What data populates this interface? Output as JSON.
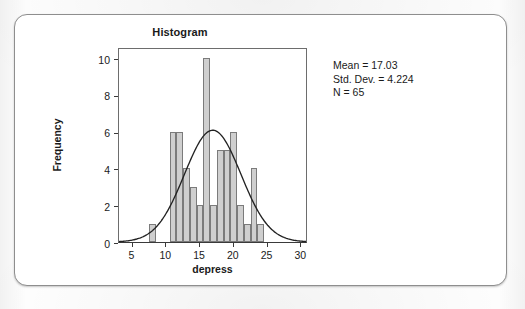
{
  "figure": {
    "title": "Histogram",
    "x_axis_title": "depress",
    "y_axis_title": "Frequency"
  },
  "stats": {
    "mean_line": "Mean = 17.03",
    "std_dev_line": "Std. Dev. = 4.224",
    "n_line": "N = 65"
  },
  "colors": {
    "bar_fill": "#cfcfcf",
    "bar_stroke": "#7b7b7b",
    "curve": "#222222",
    "axis": "#3a3a3a",
    "card_border": "#8e8e8e",
    "text": "#1a1a1a"
  },
  "chart_data": {
    "type": "bar",
    "title": "Histogram",
    "xlabel": "depress",
    "ylabel": "Frequency",
    "xlim": [
      3,
      31
    ],
    "ylim": [
      0,
      10.6
    ],
    "xticks": [
      5,
      10,
      15,
      20,
      25,
      30
    ],
    "yticks": [
      0,
      2,
      4,
      6,
      8,
      10
    ],
    "grid": false,
    "legend": null,
    "bin_width": 1,
    "bin_centers": [
      8,
      11,
      12,
      13,
      14,
      15,
      16,
      17,
      18,
      19,
      20,
      21,
      22,
      23,
      24,
      25,
      26
    ],
    "values": [
      1,
      6,
      6,
      4,
      3,
      2,
      10,
      2,
      5,
      5,
      6,
      2,
      1,
      4,
      1,
      0,
      0
    ],
    "bars": [
      {
        "center": 8,
        "frequency": 1
      },
      {
        "center": 11,
        "frequency": 6
      },
      {
        "center": 12,
        "frequency": 6
      },
      {
        "center": 13,
        "frequency": 4
      },
      {
        "center": 14,
        "frequency": 3
      },
      {
        "center": 15,
        "frequency": 2
      },
      {
        "center": 16,
        "frequency": 10
      },
      {
        "center": 17,
        "frequency": 2
      },
      {
        "center": 18,
        "frequency": 5
      },
      {
        "center": 19,
        "frequency": 5
      },
      {
        "center": 20,
        "frequency": 6
      },
      {
        "center": 21,
        "frequency": 2
      },
      {
        "center": 22,
        "frequency": 1
      },
      {
        "center": 23,
        "frequency": 4
      },
      {
        "center": 24,
        "frequency": 1
      }
    ],
    "overlay": {
      "type": "normal-curve",
      "mean": 17.03,
      "std_dev": 4.224,
      "n": 65,
      "peak_frequency": 6.14
    },
    "annotations": [
      "Mean = 17.03",
      "Std. Dev. = 4.224",
      "N = 65"
    ]
  }
}
